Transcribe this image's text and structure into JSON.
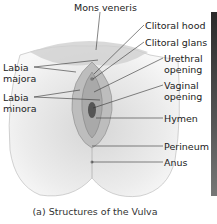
{
  "diagram": {
    "caption": "(a) Structures of the Vulva",
    "labels": {
      "mons_veneris": "Mons veneris",
      "clitoral_hood": "Clitoral hood",
      "clitoral_glans": "Clitoral glans",
      "urethral_opening": "Urethral opening",
      "vaginal_opening": "Vaginal opening",
      "hymen": "Hymen",
      "perineum": "Perineum",
      "anus": "Anus",
      "labia_majora": "Labia majora",
      "labia_minora": "Labia minora"
    },
    "colors": {
      "line": "#333333",
      "illustration_light": "#eeeeee",
      "illustration_mid": "#c8c8c8",
      "illustration_dark": "#8a8a8a",
      "side_bar": "#3a3a3a"
    }
  }
}
